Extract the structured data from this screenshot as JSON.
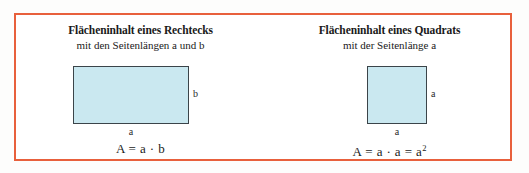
{
  "figure": {
    "border_color": "#e8603c",
    "shape_fill_color": "#cae8f0",
    "shape_stroke_color": "#3b4449",
    "background_color": "#ffffff"
  },
  "panels": [
    {
      "id": "rectangle",
      "title": "Flächeninhalt eines Rechtecks",
      "subtitle": "mit den Seitenlängen a und b",
      "shape": "rectangle",
      "label_right": "b",
      "label_bottom": "a",
      "formula": "A = a · b"
    },
    {
      "id": "square",
      "title": "Flächeninhalt eines Quadrats",
      "subtitle": "mit der Seitenlänge a",
      "shape": "square",
      "label_right": "a",
      "label_bottom": "a",
      "formula_prefix": "A = a · a = a",
      "formula_exponent": "2"
    }
  ]
}
